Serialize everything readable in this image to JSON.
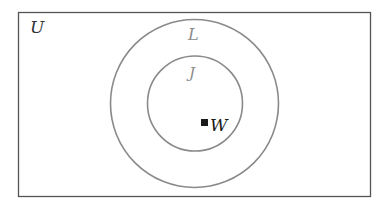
{
  "diagram": {
    "type": "venn",
    "universe": {
      "label": "U",
      "color": "#333333"
    },
    "sets": [
      {
        "label": "L",
        "color": "#8a8a8a",
        "relation": "outer"
      },
      {
        "label": "J",
        "color": "#8a8a8a",
        "relation": "subset of L"
      }
    ],
    "elements": [
      {
        "label": "W",
        "marker": "filled-square",
        "in": [
          "J",
          "L"
        ],
        "color": "#1a1a1a"
      }
    ],
    "colors": {
      "border": "#555555",
      "circle_stroke": "#8a8a8a",
      "background": "#ffffff"
    }
  }
}
